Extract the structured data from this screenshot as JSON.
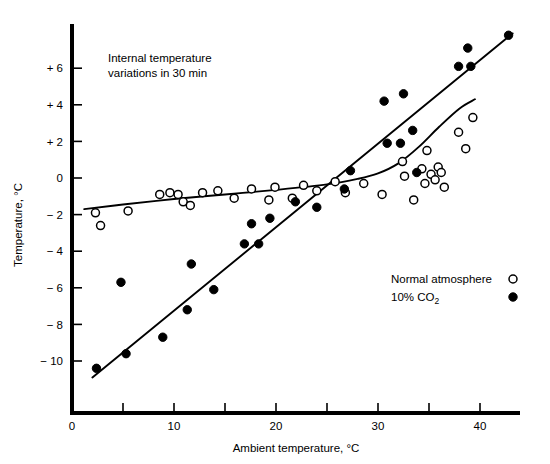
{
  "chart_data": {
    "type": "scatter",
    "title": "",
    "annotation": "Internal temperature\nvariations in 30 min",
    "annotation_line1": "Internal temperature",
    "annotation_line2": "variations in 30 min",
    "xlabel": "Ambient temperature, °C",
    "ylabel": "Temperature, °C",
    "xlim": [
      0,
      44
    ],
    "ylim": [
      -11.5,
      8.5
    ],
    "xticks": [
      0,
      5,
      10,
      15,
      20,
      25,
      30,
      35,
      40,
      45
    ],
    "xtick_labels": [
      "0",
      "",
      "10",
      "",
      "20",
      "",
      "30",
      "",
      "40",
      ""
    ],
    "yticks": [
      -10,
      -8,
      -6,
      -4,
      -2,
      0,
      2,
      4,
      6
    ],
    "ytick_labels": [
      "− 10",
      "− 8",
      "− 6",
      "− 4",
      "− 2",
      "0",
      "+ 2",
      "+ 4",
      "+ 6"
    ],
    "grid": false,
    "legend_position": "lower-right",
    "series": [
      {
        "name": "Normal atmosphere",
        "marker": "open-circle",
        "color": "#000000",
        "points": [
          [
            2.3,
            -1.9
          ],
          [
            2.8,
            -2.6
          ],
          [
            5.5,
            -1.8
          ],
          [
            8.6,
            -0.9
          ],
          [
            9.6,
            -0.8
          ],
          [
            10.4,
            -0.9
          ],
          [
            10.9,
            -1.3
          ],
          [
            11.6,
            -1.5
          ],
          [
            12.8,
            -0.8
          ],
          [
            14.3,
            -0.7
          ],
          [
            15.9,
            -1.1
          ],
          [
            17.6,
            -0.6
          ],
          [
            19.3,
            -1.2
          ],
          [
            19.9,
            -0.5
          ],
          [
            21.6,
            -1.1
          ],
          [
            22.7,
            -0.4
          ],
          [
            24.0,
            -0.7
          ],
          [
            25.8,
            -0.2
          ],
          [
            26.8,
            -0.8
          ],
          [
            28.6,
            -0.3
          ],
          [
            30.4,
            -0.9
          ],
          [
            32.4,
            0.9
          ],
          [
            32.6,
            0.1
          ],
          [
            33.5,
            -1.2
          ],
          [
            34.3,
            0.5
          ],
          [
            34.6,
            -0.3
          ],
          [
            34.8,
            1.5
          ],
          [
            35.2,
            0.2
          ],
          [
            35.6,
            -0.1
          ],
          [
            35.9,
            0.6
          ],
          [
            36.2,
            0.3
          ],
          [
            36.5,
            -0.5
          ],
          [
            37.9,
            2.5
          ],
          [
            38.6,
            1.6
          ],
          [
            39.3,
            3.3
          ]
        ]
      },
      {
        "name": "10% CO2",
        "marker": "filled-circle",
        "color": "#000000",
        "points": [
          [
            2.4,
            -10.4
          ],
          [
            4.8,
            -5.7
          ],
          [
            5.3,
            -9.6
          ],
          [
            8.9,
            -8.7
          ],
          [
            11.3,
            -7.2
          ],
          [
            11.7,
            -4.7
          ],
          [
            13.9,
            -6.1
          ],
          [
            16.9,
            -3.6
          ],
          [
            17.6,
            -2.5
          ],
          [
            18.3,
            -3.6
          ],
          [
            19.4,
            -2.2
          ],
          [
            21.9,
            -1.3
          ],
          [
            24.0,
            -1.6
          ],
          [
            26.7,
            -0.6
          ],
          [
            27.3,
            0.4
          ],
          [
            30.6,
            4.2
          ],
          [
            30.9,
            1.9
          ],
          [
            32.2,
            1.9
          ],
          [
            32.5,
            4.6
          ],
          [
            33.4,
            2.6
          ],
          [
            33.8,
            0.3
          ],
          [
            37.9,
            6.1
          ],
          [
            38.8,
            7.1
          ],
          [
            39.1,
            6.1
          ],
          [
            42.8,
            7.8
          ]
        ]
      }
    ],
    "fit_curves": [
      {
        "name": "normal-atmosphere-trend",
        "series": "Normal atmosphere",
        "shape": "sigmoid",
        "points": [
          [
            1.2,
            -1.7
          ],
          [
            5.0,
            -1.45
          ],
          [
            10.0,
            -1.15
          ],
          [
            15.0,
            -0.9
          ],
          [
            20.0,
            -0.65
          ],
          [
            25.0,
            -0.35
          ],
          [
            28.0,
            -0.05
          ],
          [
            30.0,
            0.25
          ],
          [
            32.0,
            0.8
          ],
          [
            34.0,
            1.7
          ],
          [
            36.0,
            2.8
          ],
          [
            38.0,
            3.8
          ],
          [
            39.5,
            4.3
          ]
        ]
      },
      {
        "name": "co2-trend",
        "series": "10% CO2",
        "shape": "linear",
        "points": [
          [
            2.0,
            -10.9
          ],
          [
            43.2,
            7.9
          ]
        ]
      }
    ],
    "legend": [
      {
        "label": "Normal atmosphere",
        "marker": "open-circle"
      },
      {
        "label": "10% CO",
        "sub": "2",
        "marker": "filled-circle"
      }
    ]
  }
}
